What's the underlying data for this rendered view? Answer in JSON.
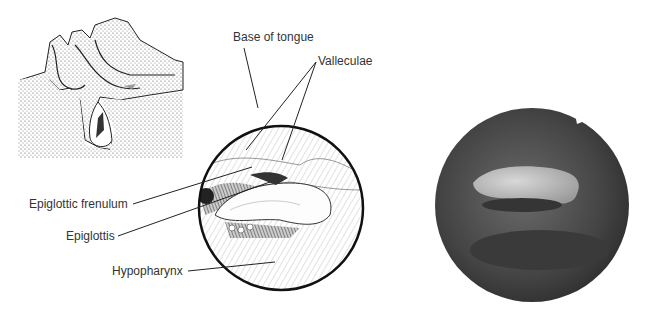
{
  "figure": {
    "inset": {
      "name": "sagittal-head-diagram",
      "arrow_color": "#888888"
    },
    "illustration": {
      "name": "laryngoscopic-view-drawing"
    },
    "photo": {
      "name": "endoscopic-photo",
      "bg": "#3f3f3f",
      "highlight": "#c9c9c9"
    },
    "labels": {
      "base_of_tongue": "Base of tongue",
      "valleculae": "Valleculae",
      "epiglottic_frenulum": "Epiglottic frenulum",
      "epiglottis": "Epiglottis",
      "hypopharynx": "Hypopharynx"
    }
  }
}
